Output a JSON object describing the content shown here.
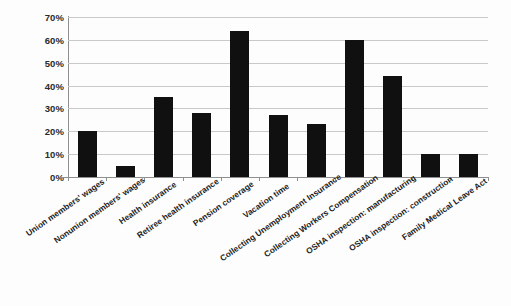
{
  "chart_data": {
    "type": "bar",
    "title": "",
    "xlabel": "",
    "ylabel": "",
    "ylim": [
      0,
      70
    ],
    "grid": true,
    "legend": false,
    "y_tick_labels": [
      "70%",
      "60%",
      "50%",
      "40%",
      "30%",
      "20%",
      "10%",
      "0%"
    ],
    "y_tick_values": [
      70,
      60,
      50,
      40,
      30,
      20,
      10,
      0
    ],
    "bar_color": "#101010",
    "gridline_color": "#c9c9c9",
    "axis_color": "#8f8f8f",
    "categories": [
      "Union members' wages",
      "Nonunion members' wages",
      "Health insurance",
      "Retiree health insurance",
      "Pension coverage",
      "Vacation time",
      "Collecting Unemployment Insurance",
      "Collecting Workers Compensation",
      "OSHA inspection: manufacturing",
      "OSHA inspection: construction",
      "Family Medical Leave Act"
    ],
    "values": [
      20,
      5,
      35,
      28,
      64,
      27,
      23,
      60,
      44,
      10,
      10
    ]
  }
}
